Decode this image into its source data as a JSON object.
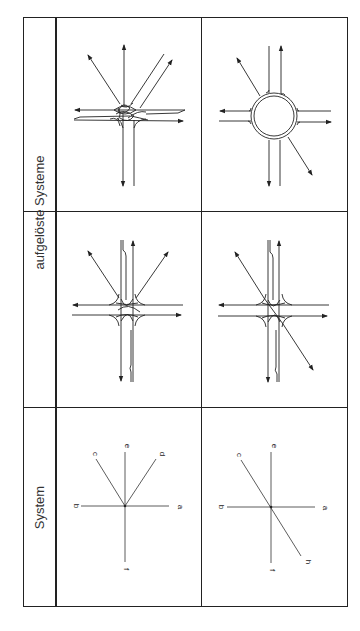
{
  "table": {
    "header_labels": {
      "resolved_systems": "aufgelöste Systeme",
      "system": "System"
    },
    "system_diagrams": [
      {
        "labels": {
          "a": "a",
          "b": "b",
          "c": "c",
          "d": "d",
          "e": "e",
          "f": "f"
        }
      },
      {
        "labels": {
          "a": "a",
          "b": "b",
          "c": "c",
          "e": "e",
          "f": "f",
          "h": "h"
        }
      }
    ],
    "resolved_diagrams": [
      {
        "name": "five-leg-intersection-with-turning-lanes"
      },
      {
        "name": "roundabout"
      },
      {
        "name": "four-leg-intersection-straight"
      },
      {
        "name": "four-leg-intersection-with-diagonal"
      }
    ]
  },
  "colors": {
    "line": "#222222",
    "background": "#ffffff"
  }
}
